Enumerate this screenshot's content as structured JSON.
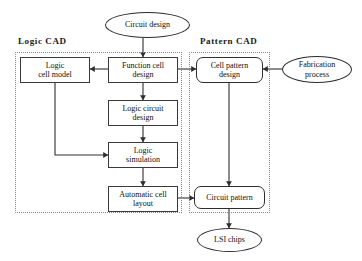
{
  "diagram": {
    "title_hidden": "",
    "groups": [
      {
        "id": "logic-cad",
        "label": "Logic  CAD",
        "x": 15,
        "y": 52,
        "w": 167,
        "h": 161,
        "label_x": 18,
        "label_y": 36
      },
      {
        "id": "pattern-cad",
        "label": "Pattern  CAD",
        "x": 189,
        "y": 52,
        "w": 81,
        "h": 161,
        "label_x": 200,
        "label_y": 36
      }
    ],
    "nodes": [
      {
        "id": "circuit-design",
        "label": "Circuit design",
        "shape": "ellipse",
        "x": 105,
        "y": 12,
        "w": 85,
        "h": 26
      },
      {
        "id": "logic-cell-model",
        "label": "Logic\ncell model",
        "shape": "rect",
        "x": 20,
        "y": 57,
        "w": 70,
        "h": 26
      },
      {
        "id": "function-cell-design",
        "label": "Function cell\ndesign",
        "shape": "rect",
        "x": 108,
        "y": 57,
        "w": 70,
        "h": 26
      },
      {
        "id": "cell-pattern-design",
        "label": "Cell pattern\ndesign",
        "shape": "round",
        "x": 196,
        "y": 57,
        "w": 67,
        "h": 26
      },
      {
        "id": "fabrication-process",
        "label": "Fabrication\nprocess",
        "shape": "ellipse",
        "x": 282,
        "y": 56,
        "w": 70,
        "h": 27
      },
      {
        "id": "logic-circuit-design",
        "label": "Logic circuit\ndesign",
        "shape": "rect",
        "x": 108,
        "y": 100,
        "w": 70,
        "h": 26
      },
      {
        "id": "logic-simulation",
        "label": "Logic\nsimulation",
        "shape": "rect",
        "x": 108,
        "y": 142,
        "w": 70,
        "h": 26
      },
      {
        "id": "automatic-cell-layout",
        "label": "Automatic cell\nlayout",
        "shape": "rect",
        "x": 108,
        "y": 186,
        "w": 70,
        "h": 26
      },
      {
        "id": "circuit-pattern",
        "label": "Circuit pattern",
        "shape": "round",
        "x": 194,
        "y": 186,
        "w": 71,
        "h": 23
      },
      {
        "id": "lsi-chips",
        "label": "LSI chips",
        "shape": "ellipse",
        "x": 197,
        "y": 228,
        "w": 65,
        "h": 24
      }
    ],
    "edges": [
      {
        "id": "e-circuit-design-to-function-cell",
        "from": "circuit-design",
        "to": "function-cell-design",
        "points": "143,38 143,57",
        "arrow": "down"
      },
      {
        "id": "e-function-cell-to-logic-cell-model",
        "from": "function-cell-design",
        "to": "logic-cell-model",
        "points": "108,69 90,69",
        "arrow": "left"
      },
      {
        "id": "e-function-cell-to-cell-pattern",
        "from": "function-cell-design",
        "to": "cell-pattern-design",
        "points": "178,69 196,69",
        "arrow": "right"
      },
      {
        "id": "e-fabrication-to-cell-pattern",
        "from": "fabrication-process",
        "to": "cell-pattern-design",
        "points": "282,69 263,69",
        "arrow": "left"
      },
      {
        "id": "e-function-cell-to-logic-circuit",
        "from": "function-cell-design",
        "to": "logic-circuit-design",
        "points": "143,83 143,100",
        "arrow": "down"
      },
      {
        "id": "e-logic-circuit-to-logic-sim",
        "from": "logic-circuit-design",
        "to": "logic-simulation",
        "points": "143,126 143,142",
        "arrow": "down"
      },
      {
        "id": "e-logic-cell-model-to-logic-sim",
        "from": "logic-cell-model",
        "to": "logic-simulation",
        "points": "55,83 55,155 108,155",
        "arrow": "right"
      },
      {
        "id": "e-logic-sim-to-auto-layout",
        "from": "logic-simulation",
        "to": "automatic-cell-layout",
        "points": "143,168 143,186",
        "arrow": "down"
      },
      {
        "id": "e-auto-layout-to-circuit-pattern",
        "from": "automatic-cell-layout",
        "to": "circuit-pattern",
        "points": "178,198 194,198",
        "arrow": "right"
      },
      {
        "id": "e-cell-pattern-to-circuit-pattern",
        "from": "cell-pattern-design",
        "to": "circuit-pattern",
        "points": "229,83 229,186",
        "arrow": "down"
      },
      {
        "id": "e-circuit-pattern-to-lsi",
        "from": "circuit-pattern",
        "to": "lsi-chips",
        "points": "229,209 229,228",
        "arrow": "down"
      }
    ],
    "colors": {
      "stroke": "#2e2e2e",
      "group_stroke": "#8a8a8a",
      "text": "#101010",
      "background": "#ffffff"
    }
  }
}
